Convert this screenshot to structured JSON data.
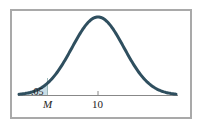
{
  "diagram": {
    "type": "normal-distribution",
    "mean_label": "10",
    "critical_label": "M",
    "tail_area_label": ".05",
    "tail": "left",
    "colors": {
      "curve": "#2f4f5f",
      "shade": "#c9dde6",
      "axis": "#888888",
      "frame": "#a9a9a9"
    }
  }
}
